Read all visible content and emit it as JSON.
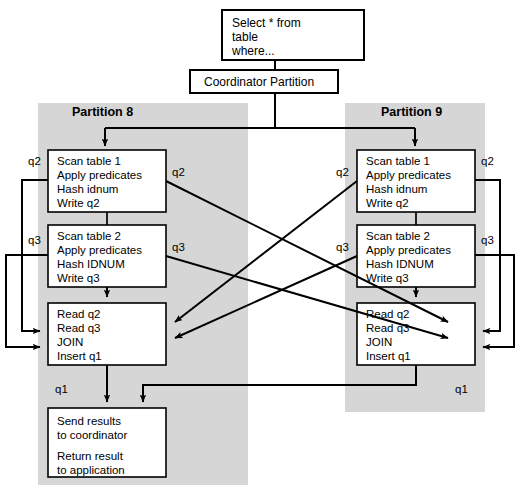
{
  "diagram": {
    "colors": {
      "panel_background": "#d6d6d6",
      "box_background": "#ffffff",
      "line": "#000000",
      "page_background": "#ffffff"
    }
  },
  "top": {
    "query_box": {
      "name": "query-box",
      "lines": [
        "Select * from",
        "table",
        "where..."
      ]
    },
    "coordinator_box": {
      "name": "coordinator-partition-box",
      "label": "Coordinator Partition"
    }
  },
  "partitions": [
    {
      "id": "partition-8",
      "title": "Partition 8",
      "steps": [
        {
          "id": "scan-table-1",
          "lines": [
            "Scan table 1",
            "Apply predicates",
            "Hash idnum",
            "Write q2"
          ]
        },
        {
          "id": "scan-table-2",
          "lines": [
            "Scan table 2",
            "Apply predicates",
            "Hash IDNUM",
            "Write q3"
          ]
        },
        {
          "id": "join",
          "lines": [
            "Read q2",
            "Read q3",
            "JOIN",
            "Insert q1"
          ]
        },
        {
          "id": "send-results",
          "lines": [
            "Send results",
            "to coordinator",
            "",
            "Return result",
            "to application"
          ]
        }
      ],
      "queue_labels": {
        "q2_left": "q2",
        "q2_right": "q2",
        "q3_left": "q3",
        "q3_right": "q3",
        "q1": "q1"
      }
    },
    {
      "id": "partition-9",
      "title": "Partition 9",
      "steps": [
        {
          "id": "scan-table-1",
          "lines": [
            "Scan table 1",
            "Apply predicates",
            "Hash idnum",
            "Write q2"
          ]
        },
        {
          "id": "scan-table-2",
          "lines": [
            "Scan table 2",
            "Apply predicates",
            "Hash IDNUM",
            "Write q3"
          ]
        },
        {
          "id": "join",
          "lines": [
            "Read q2",
            "Read q3",
            "JOIN",
            "Insert q1"
          ]
        }
      ],
      "queue_labels": {
        "q2_left": "q2",
        "q2_right": "q2",
        "q3_left": "q3",
        "q3_right": "q3",
        "q1": "q1"
      }
    }
  ]
}
